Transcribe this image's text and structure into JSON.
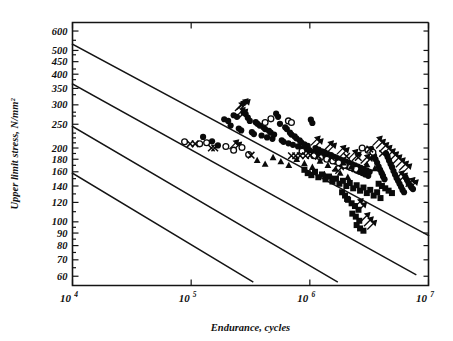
{
  "chart_data": {
    "type": "scatter",
    "title": "",
    "xlabel": "Endurance, cycles",
    "ylabel": "Upper limit stress, N/mm²",
    "xscale": "log",
    "yscale": "log",
    "xlim": [
      10000,
      10000000
    ],
    "ylim": [
      55,
      650
    ],
    "grid": false,
    "legend": "none",
    "xticks": [
      {
        "value": 10000,
        "mantissa": "10",
        "exponent": "4",
        "label": "10⁴"
      },
      {
        "value": 100000,
        "mantissa": "10",
        "exponent": "5",
        "label": "10⁵"
      },
      {
        "value": 1000000,
        "mantissa": "10",
        "exponent": "6",
        "label": "10⁶"
      },
      {
        "value": 10000000,
        "mantissa": "10",
        "exponent": "7",
        "label": "10⁷"
      }
    ],
    "yticks": [
      {
        "value": 600,
        "label": "600"
      },
      {
        "value": 500,
        "label": "500"
      },
      {
        "value": 450,
        "label": "450"
      },
      {
        "value": 400,
        "label": "400"
      },
      {
        "value": 350,
        "label": "350"
      },
      {
        "value": 300,
        "label": "300"
      },
      {
        "value": 250,
        "label": "250"
      },
      {
        "value": 200,
        "label": "200"
      },
      {
        "value": 180,
        "label": "180"
      },
      {
        "value": 160,
        "label": "160"
      },
      {
        "value": 140,
        "label": "140"
      },
      {
        "value": 120,
        "label": "120"
      },
      {
        "value": 100,
        "label": "100"
      },
      {
        "value": 90,
        "label": "90"
      },
      {
        "value": 80,
        "label": "80"
      },
      {
        "value": 70,
        "label": "70"
      },
      {
        "value": 60,
        "label": "60"
      }
    ],
    "yticks_minor": [
      550,
      480,
      420,
      380,
      330,
      280,
      270,
      230,
      220,
      210,
      190,
      170,
      150,
      130,
      110,
      95,
      85,
      75,
      65
    ],
    "reference_lines": [
      {
        "name": "design-line-1",
        "x0": 10000,
        "y0": 530,
        "x1": 10000000,
        "y1": 88
      },
      {
        "name": "design-line-2",
        "x0": 10000,
        "y0": 365,
        "x1": 7800000,
        "y1": 61
      },
      {
        "name": "design-line-3",
        "x0": 10000,
        "y0": 245,
        "x1": 1700000,
        "y1": 57
      },
      {
        "name": "design-line-4",
        "x0": 10000,
        "y0": 158,
        "x1": 330000,
        "y1": 57
      }
    ],
    "series": [
      {
        "name": "filled-circle",
        "marker": "filled-circle",
        "color": "#0a0a0a",
        "points": [
          [
            126000,
            222
          ],
          [
            150000,
            213
          ],
          [
            168000,
            205
          ],
          [
            190000,
            262
          ],
          [
            205000,
            258
          ],
          [
            215000,
            247
          ],
          [
            228000,
            272
          ],
          [
            243000,
            268
          ],
          [
            252000,
            240
          ],
          [
            264000,
            236
          ],
          [
            276000,
            279
          ],
          [
            288000,
            275
          ],
          [
            300000,
            266
          ],
          [
            312000,
            258
          ],
          [
            325000,
            232
          ],
          [
            338000,
            228
          ],
          [
            350000,
            255
          ],
          [
            362000,
            251
          ],
          [
            378000,
            247
          ],
          [
            392000,
            225
          ],
          [
            406000,
            243
          ],
          [
            420000,
            239
          ],
          [
            436000,
            221
          ],
          [
            452000,
            235
          ],
          [
            468000,
            231
          ],
          [
            484000,
            218
          ],
          [
            500000,
            227
          ],
          [
            520000,
            276
          ],
          [
            540000,
            268
          ],
          [
            560000,
            251
          ],
          [
            580000,
            215
          ],
          [
            600000,
            212
          ],
          [
            620000,
            243
          ],
          [
            640000,
            239
          ],
          [
            660000,
            209
          ],
          [
            680000,
            231
          ],
          [
            700000,
            227
          ],
          [
            720000,
            206
          ],
          [
            745000,
            223
          ],
          [
            770000,
            219
          ],
          [
            795000,
            203
          ],
          [
            820000,
            215
          ],
          [
            845000,
            211
          ],
          [
            870000,
            200
          ],
          [
            900000,
            207
          ],
          [
            930000,
            198
          ],
          [
            960000,
            204
          ],
          [
            990000,
            196
          ],
          [
            1020000,
            261
          ],
          [
            1050000,
            253
          ],
          [
            1080000,
            193
          ],
          [
            1115000,
            200
          ],
          [
            1150000,
            191
          ],
          [
            1185000,
            197
          ],
          [
            1220000,
            188
          ],
          [
            1260000,
            194
          ],
          [
            1300000,
            186
          ],
          [
            1340000,
            192
          ],
          [
            1380000,
            183
          ],
          [
            1420000,
            189
          ],
          [
            1465000,
            181
          ],
          [
            1510000,
            187
          ],
          [
            1555000,
            178
          ],
          [
            1600000,
            184
          ],
          [
            1650000,
            176
          ],
          [
            1700000,
            182
          ],
          [
            1750000,
            174
          ],
          [
            1800000,
            180
          ],
          [
            1855000,
            172
          ],
          [
            1910000,
            178
          ],
          [
            1965000,
            170
          ],
          [
            2020000,
            176
          ],
          [
            2080000,
            168
          ],
          [
            2140000,
            174
          ],
          [
            2200000,
            166
          ],
          [
            2265000,
            172
          ],
          [
            2330000,
            164
          ],
          [
            2400000,
            170
          ],
          [
            2470000,
            162
          ],
          [
            2540000,
            168
          ],
          [
            2615000,
            160
          ],
          [
            2690000,
            166
          ],
          [
            2770000,
            158
          ],
          [
            2850000,
            164
          ],
          [
            2930000,
            156
          ],
          [
            3015000,
            162
          ],
          [
            3105000,
            154
          ],
          [
            3195000,
            160
          ],
          [
            3290000,
            198
          ],
          [
            3385000,
            192
          ],
          [
            3480000,
            186
          ],
          [
            3580000,
            180
          ],
          [
            3690000,
            174
          ],
          [
            3800000,
            168
          ],
          [
            3910000,
            163
          ],
          [
            4020000,
            158
          ],
          [
            4140000,
            153
          ],
          [
            4260000,
            149
          ],
          [
            4390000,
            190
          ],
          [
            4520000,
            184
          ],
          [
            4650000,
            178
          ],
          [
            4790000,
            172
          ],
          [
            4930000,
            167
          ],
          [
            5070000,
            161
          ],
          [
            5220000,
            156
          ],
          [
            5380000,
            151
          ],
          [
            5540000,
            147
          ],
          [
            5700000,
            143
          ],
          [
            5870000,
            139
          ],
          [
            6040000,
            135
          ],
          [
            6220000,
            132
          ],
          [
            6400000,
            152
          ],
          [
            6590000,
            148
          ],
          [
            6790000,
            144
          ],
          [
            7000000,
            141
          ],
          [
            7200000,
            138
          ],
          [
            7400000,
            136
          ]
        ]
      },
      {
        "name": "open-circle",
        "marker": "open-circle",
        "color": "#0a0a0a",
        "points": [
          [
            88000,
            212
          ],
          [
            118000,
            208
          ],
          [
            135000,
            210
          ],
          [
            196000,
            203
          ],
          [
            228000,
            196
          ],
          [
            268000,
            201
          ],
          [
            305000,
            188
          ],
          [
            420000,
            254
          ],
          [
            470000,
            263
          ],
          [
            660000,
            258
          ],
          [
            700000,
            254
          ],
          [
            860000,
            194
          ],
          [
            1080000,
            186
          ],
          [
            1230000,
            183
          ],
          [
            1390000,
            180
          ],
          [
            1560000,
            177
          ],
          [
            1750000,
            174
          ],
          [
            1960000,
            170
          ],
          [
            2200000,
            167
          ],
          [
            2460000,
            164
          ],
          [
            2760000,
            200
          ],
          [
            3090000,
            196
          ],
          [
            3400000,
            192
          ]
        ]
      },
      {
        "name": "cross-marker",
        "marker": "cross",
        "color": "#0a0a0a",
        "points": [
          [
            98000,
            208
          ],
          [
            108000,
            208
          ],
          [
            148000,
            200
          ],
          [
            158000,
            200
          ],
          [
            320000,
            187
          ],
          [
            700000,
            186
          ],
          [
            760000,
            186
          ],
          [
            830000,
            186
          ],
          [
            920000,
            186
          ],
          [
            1010000,
            187
          ],
          [
            1180000,
            185
          ],
          [
            1520000,
            183
          ],
          [
            2040000,
            185
          ],
          [
            2560000,
            183
          ],
          [
            3200000,
            198
          ],
          [
            4100000,
            190
          ]
        ]
      },
      {
        "name": "filled-square",
        "marker": "filled-square",
        "color": "#0a0a0a",
        "points": [
          [
            900000,
            163
          ],
          [
            960000,
            158
          ],
          [
            1030000,
            155
          ],
          [
            1105000,
            160
          ],
          [
            1180000,
            152
          ],
          [
            1265000,
            156
          ],
          [
            1355000,
            149
          ],
          [
            1450000,
            153
          ],
          [
            1550000,
            146
          ],
          [
            1660000,
            150
          ],
          [
            1775000,
            143
          ],
          [
            1900000,
            147
          ],
          [
            2030000,
            140
          ],
          [
            2170000,
            144
          ],
          [
            2320000,
            137
          ],
          [
            2480000,
            141
          ],
          [
            2650000,
            134
          ],
          [
            2830000,
            138
          ],
          [
            3020000,
            131
          ],
          [
            3230000,
            135
          ],
          [
            3450000,
            128
          ],
          [
            3690000,
            132
          ],
          [
            3940000,
            125
          ],
          [
            2100000,
            123
          ],
          [
            2250000,
            119
          ],
          [
            2400000,
            116
          ],
          [
            2570000,
            112
          ],
          [
            2280000,
            108
          ],
          [
            2440000,
            105
          ],
          [
            2610000,
            101
          ],
          [
            2480000,
            97
          ],
          [
            2650000,
            94
          ],
          [
            2830000,
            92
          ],
          [
            1980000,
            128
          ],
          [
            2060000,
            124
          ],
          [
            1870000,
            132
          ],
          [
            3800000,
            143
          ],
          [
            4050000,
            140
          ],
          [
            4320000,
            137
          ],
          [
            4610000,
            134
          ],
          [
            4920000,
            131
          ]
        ]
      },
      {
        "name": "filled-triangle",
        "marker": "filled-triangle",
        "color": "#0a0a0a",
        "points": [
          [
            360000,
            178
          ],
          [
            420000,
            172
          ],
          [
            490000,
            183
          ],
          [
            570000,
            176
          ],
          [
            665000,
            170
          ],
          [
            775000,
            180
          ],
          [
            900000,
            173
          ],
          [
            1050000,
            167
          ],
          [
            1220000,
            177
          ],
          [
            1420000,
            170
          ],
          [
            1650000,
            164
          ],
          [
            1920000,
            174
          ],
          [
            2240000,
            168
          ],
          [
            2600000,
            161
          ],
          [
            3030000,
            171
          ],
          [
            3530000,
            165
          ],
          [
            4100000,
            159
          ],
          [
            1330000,
            156
          ],
          [
            1550000,
            150
          ],
          [
            1800000,
            158
          ],
          [
            2090000,
            152
          ]
        ]
      }
    ],
    "runout_points": [
      [
        234000,
        283
      ],
      [
        243000,
        287
      ],
      [
        252000,
        291
      ],
      [
        262000,
        289
      ],
      [
        238000,
        268
      ],
      [
        250000,
        264
      ],
      [
        210000,
        198
      ],
      [
        222000,
        194
      ],
      [
        1020000,
        205
      ],
      [
        1080000,
        200
      ],
      [
        1320000,
        196
      ],
      [
        1400000,
        192
      ],
      [
        1680000,
        188
      ],
      [
        1790000,
        184
      ],
      [
        2120000,
        181
      ],
      [
        2260000,
        177
      ],
      [
        2680000,
        173
      ],
      [
        2860000,
        170
      ],
      [
        3400000,
        205
      ],
      [
        3620000,
        199
      ],
      [
        3860000,
        193
      ],
      [
        4110000,
        188
      ],
      [
        4380000,
        182
      ],
      [
        4670000,
        177
      ],
      [
        4980000,
        172
      ],
      [
        5310000,
        167
      ],
      [
        5660000,
        162
      ],
      [
        6030000,
        158
      ],
      [
        2350000,
        114
      ],
      [
        2510000,
        110
      ],
      [
        2680000,
        100
      ],
      [
        2860000,
        96
      ],
      [
        3050000,
        93
      ],
      [
        5200000,
        148
      ],
      [
        5540000,
        145
      ],
      [
        6420000,
        139
      ],
      [
        6840000,
        136
      ],
      [
        1540000,
        161
      ],
      [
        1640000,
        157
      ]
    ]
  }
}
